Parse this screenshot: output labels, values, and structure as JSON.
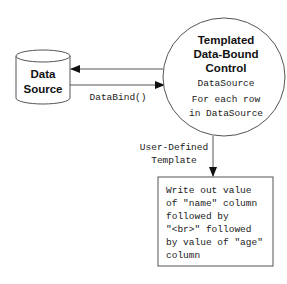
{
  "diagram": {
    "data_source": {
      "line1": "Data",
      "line2": "Source"
    },
    "control": {
      "title_line1": "Templated",
      "title_line2": "Data-Bound",
      "title_line3": "Control",
      "property": "DataSource",
      "loop_line1": "For each row",
      "loop_line2": "in DataSource"
    },
    "edges": {
      "databind_label": "DataBind()",
      "template_label_line1": "User-Defined",
      "template_label_line2": "Template"
    },
    "template_box": {
      "lines": [
        "Write out value",
        "of \"name\" column",
        "followed by",
        "\"<br>\" followed",
        "by value of \"age\"",
        "column"
      ]
    }
  }
}
